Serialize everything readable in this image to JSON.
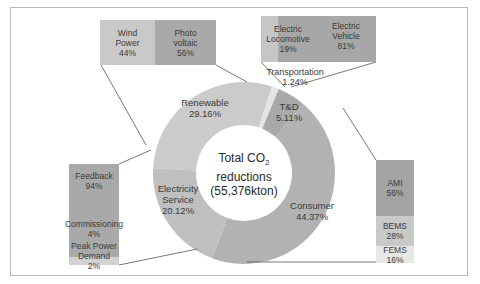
{
  "chart_data": {
    "type": "pie",
    "subtype": "donut-with-breakdown-bars",
    "title": "Total CO2 reductions (55,376kton)",
    "center_label": {
      "line1": "Total CO",
      "sub": "2",
      "line2": "reductions",
      "line3": "(55,376kton)"
    },
    "total_kton": 55376,
    "slices": [
      {
        "name": "Renewable",
        "value": 29.16,
        "label": "29.16%",
        "color": "#cbcbcb"
      },
      {
        "name": "Transportation",
        "value": 1.24,
        "label": "1.24%",
        "color": "#e4e4e4"
      },
      {
        "name": "T&D",
        "value": 5.11,
        "label": "5.11%",
        "color": "#a9a9a9"
      },
      {
        "name": "Consumer",
        "value": 44.37,
        "label": "44.37%",
        "color": "#b2b2b2"
      },
      {
        "name": "Electricity Service",
        "value": 20.12,
        "label": "20.12%",
        "color": "#bfbfbf"
      }
    ],
    "breakdowns": [
      {
        "parent": "Renewable",
        "items": [
          {
            "name": "Wind Power",
            "value": 44,
            "label": "44%"
          },
          {
            "name": "Photo voltaic",
            "value": 56,
            "label": "56%"
          }
        ]
      },
      {
        "parent": "Transportation",
        "items": [
          {
            "name": "Electric Locomotive",
            "value": 19,
            "label": "19%"
          },
          {
            "name": "Electric Vehicle",
            "value": 81,
            "label": "81%"
          }
        ]
      },
      {
        "parent": "Consumer",
        "items": [
          {
            "name": "AMI",
            "value": 56,
            "label": "56%"
          },
          {
            "name": "BEMS",
            "value": 28,
            "label": "28%"
          },
          {
            "name": "FEMS",
            "value": 16,
            "label": "16%"
          }
        ]
      },
      {
        "parent": "Electricity Service",
        "items": [
          {
            "name": "Feedback",
            "value": 94,
            "label": "94%"
          },
          {
            "name": "Commissioning",
            "value": 4,
            "label": "4%"
          },
          {
            "name": "Peak Power Demand",
            "value": 2,
            "label": "2%"
          }
        ]
      }
    ]
  },
  "donut": {
    "renewable": {
      "name": "Renewable",
      "pct": "29.16%"
    },
    "transportation": {
      "name": "Transportation",
      "pct": "1.24%"
    },
    "td": {
      "name": "T&D",
      "pct": "5.11%"
    },
    "consumer": {
      "name": "Consumer",
      "pct": "44.37%"
    },
    "electricity": {
      "name1": "Electricity",
      "name2": "Service",
      "pct": "20.12%"
    }
  },
  "boxes": {
    "renewable": {
      "wind": {
        "l1": "Wind",
        "l2": "Power",
        "pct": "44%"
      },
      "pv": {
        "l1": "Photo",
        "l2": "voltaic",
        "pct": "56%"
      }
    },
    "transport": {
      "loco": {
        "l1": "Electric",
        "l2": "Locomotive",
        "pct": "19%"
      },
      "ev": {
        "l1": "Electric",
        "l2": "Vehicle",
        "pct": "81%"
      }
    },
    "consumer": {
      "ami": {
        "l1": "AMI",
        "pct": "56%"
      },
      "bems": {
        "l1": "BEMS",
        "pct": "28%"
      },
      "fems": {
        "l1": "FEMS",
        "pct": "16%"
      }
    },
    "electricity": {
      "feedback": {
        "l1": "Feedback",
        "pct": "94%"
      },
      "commissioning": {
        "l1": "Commissioning",
        "pct": "4%"
      },
      "peak": {
        "l1": "Peak Power",
        "l2": "Demand",
        "pct": "2%"
      }
    }
  },
  "colors": {
    "wind": "#c9c9c9",
    "pv": "#a9a9a9",
    "loco": "#c6c6c6",
    "ev": "#a7a7a7",
    "ami": "#a4a4a4",
    "bems": "#c9c9c9",
    "fems": "#e7e7e7",
    "feedback": "#a9a9a9",
    "peak": "#d2d2d2",
    "line": "#555555"
  }
}
